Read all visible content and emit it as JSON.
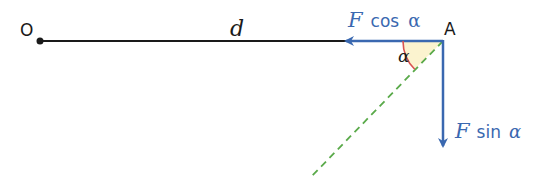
{
  "diagram": {
    "point_o": "O",
    "point_a": "A",
    "distance_label": "d",
    "horizontal_component": {
      "symbol": "F",
      "function": "cos",
      "angle": "α"
    },
    "vertical_component": {
      "symbol": "F",
      "function": "sin",
      "angle": "α"
    },
    "angle_label": "α",
    "colors": {
      "lever_line": "#1a1a1a",
      "force_component": "#3a68b0",
      "force_line": "#5aaa4a",
      "angle_arc": "#d9534f",
      "angle_fill": "#fbf3cf"
    }
  }
}
